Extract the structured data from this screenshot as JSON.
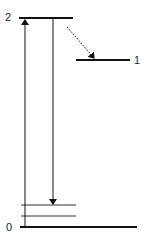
{
  "diagram": {
    "type": "energy-level-diagram",
    "levels": [
      {
        "id": "level-2",
        "label": "2"
      },
      {
        "id": "level-1",
        "label": "1"
      },
      {
        "id": "level-0",
        "label": "0"
      }
    ],
    "sublevels_count": 2,
    "transitions": [
      {
        "from": "0",
        "to": "2",
        "style": "solid",
        "direction": "up"
      },
      {
        "from": "2",
        "to": "0-sublevel",
        "style": "solid",
        "direction": "down"
      },
      {
        "from": "2",
        "to": "1",
        "style": "dotted",
        "direction": "down"
      }
    ],
    "colors": {
      "line": "#111111",
      "text": "#222222"
    }
  }
}
